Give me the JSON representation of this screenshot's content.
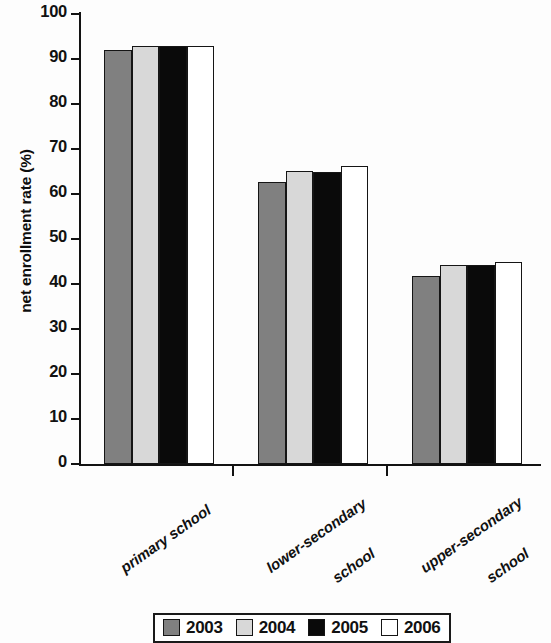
{
  "chart_data": {
    "type": "bar",
    "title": "",
    "xlabel": "",
    "ylabel": "net enrollment rate (%)",
    "categories": [
      "primary school",
      "lower-secondary school",
      "upper-secondary school"
    ],
    "category_lines": [
      [
        "primary school"
      ],
      [
        "lower-secondary",
        "school"
      ],
      [
        "upper-secondary",
        "school"
      ]
    ],
    "series": [
      {
        "name": "2003",
        "color": "#808080",
        "values": [
          92.0,
          62.7,
          41.7
        ]
      },
      {
        "name": "2004",
        "color": "#d8d8d8",
        "values": [
          93.0,
          65.2,
          44.3
        ]
      },
      {
        "name": "2005",
        "color": "#0a0a0a",
        "values": [
          93.0,
          64.8,
          44.2
        ]
      },
      {
        "name": "2006",
        "color": "#ffffff",
        "values": [
          93.0,
          66.3,
          45.0
        ]
      }
    ],
    "ylim": [
      0,
      100
    ],
    "yticks": [
      0,
      10,
      20,
      30,
      40,
      50,
      60,
      70,
      80,
      90,
      100
    ],
    "ytick_labels": [
      "0",
      "10",
      "20",
      "30",
      "40",
      "50",
      "60",
      "70",
      "80",
      "90",
      "100"
    ],
    "grid": false,
    "legend_position": "bottom",
    "legend_entries": [
      "2003",
      "2004",
      "2005",
      "2006"
    ]
  }
}
